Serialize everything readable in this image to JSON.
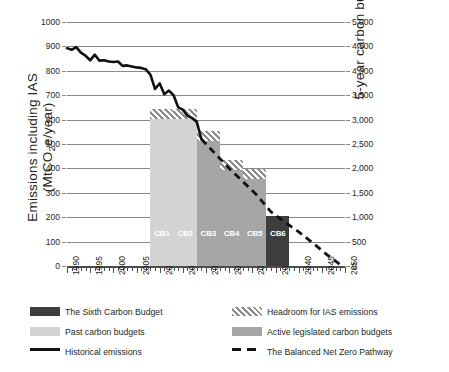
{
  "chart_data": {
    "type": "bar",
    "title": "",
    "ylabel_left_line1": "Emissions including IAS",
    "ylabel_left_line2": "(MtCO2e/year)",
    "ylabel_right": "5-year carbon budget (MtCO2e)",
    "xlabel": "",
    "xlim": [
      1990,
      2050
    ],
    "ylim_left": [
      0,
      1000
    ],
    "ylim_right": [
      0,
      5000
    ],
    "grid": true,
    "legend_position": "below",
    "y_ticks_left": [
      "0",
      "100",
      "200",
      "300",
      "400",
      "500",
      "600",
      "700",
      "800",
      "900",
      "1000"
    ],
    "y_ticks_right": [
      "0",
      "500",
      "1,000",
      "1,500",
      "2,000",
      "2,500",
      "3,000",
      "3,500",
      "4,000",
      "4,500",
      "5,000"
    ],
    "x_ticks": [
      "1990",
      "1995",
      "2000",
      "2005",
      "2010",
      "2015",
      "2020",
      "2025",
      "2030",
      "2035",
      "2040",
      "2045",
      "2050"
    ],
    "categories": [
      "CB1",
      "CB2",
      "CB3",
      "CB4",
      "CB5",
      "CB6"
    ],
    "bars": [
      {
        "label": "CB1",
        "period": "2008-2012",
        "x_start": 2008,
        "x_end": 2013,
        "budget_annual": 602,
        "budget_5yr": 3010,
        "headroom_top": 642,
        "headroom_5yr": 3210,
        "series": "Past carbon budgets",
        "color": "#d3d3d3"
      },
      {
        "label": "CB2",
        "period": "2013-2017",
        "x_start": 2013,
        "x_end": 2018,
        "budget_annual": 602,
        "budget_5yr": 3010,
        "headroom_top": 642,
        "headroom_5yr": 3210,
        "series": "Past carbon budgets",
        "color": "#d3d3d3"
      },
      {
        "label": "CB3",
        "period": "2018-2022",
        "x_start": 2018,
        "x_end": 2023,
        "budget_annual": 513,
        "budget_5yr": 2565,
        "headroom_top": 553,
        "headroom_5yr": 2765,
        "series": "Active legislated carbon budgets",
        "color": "#a6a6a6"
      },
      {
        "label": "CB4",
        "period": "2023-2027",
        "x_start": 2023,
        "x_end": 2028,
        "budget_annual": 393,
        "budget_5yr": 1965,
        "headroom_top": 433,
        "headroom_5yr": 2165,
        "series": "Active legislated carbon budgets",
        "color": "#a6a6a6"
      },
      {
        "label": "CB5",
        "period": "2028-2032",
        "x_start": 2028,
        "x_end": 2033,
        "budget_annual": 356,
        "budget_5yr": 1780,
        "headroom_top": 396,
        "headroom_5yr": 1980,
        "series": "Active legislated carbon budgets",
        "color": "#a6a6a6"
      },
      {
        "label": "CB6",
        "period": "2033-2037",
        "x_start": 2033,
        "x_end": 2038,
        "budget_annual": 203,
        "budget_5yr": 1015,
        "headroom_top": 203,
        "headroom_5yr": 1015,
        "series": "The Sixth Carbon Budget",
        "color": "#3d3d3d"
      }
    ],
    "series": [
      {
        "name": "Historical emissions",
        "type": "line",
        "style": "solid",
        "color": "#111111",
        "x": [
          1990,
          1991,
          1992,
          1993,
          1994,
          1995,
          1996,
          1997,
          1998,
          1999,
          2000,
          2001,
          2002,
          2003,
          2004,
          2005,
          2006,
          2007,
          2008,
          2009,
          2010,
          2011,
          2012,
          2013,
          2014,
          2015,
          2016,
          2017,
          2018,
          2019
        ],
        "values": [
          893,
          886,
          897,
          874,
          862,
          843,
          866,
          842,
          843,
          838,
          836,
          838,
          820,
          822,
          818,
          814,
          812,
          806,
          784,
          726,
          748,
          704,
          719,
          700,
          650,
          641,
          615,
          606,
          592,
          520
        ]
      },
      {
        "name": "The Balanced Net Zero Pathway",
        "type": "line",
        "style": "dashed",
        "color": "#111111",
        "x": [
          2019,
          2022,
          2025,
          2028,
          2031,
          2034,
          2037,
          2040,
          2043,
          2046,
          2049
        ],
        "values": [
          520,
          460,
          400,
          345,
          290,
          222,
          180,
          140,
          95,
          48,
          5
        ]
      }
    ]
  },
  "legend": {
    "items": [
      {
        "label": "The Sixth Carbon Budget",
        "swatch": "solid",
        "color": "#3d3d3d",
        "column": "left"
      },
      {
        "label": "Past carbon budgets",
        "swatch": "solid",
        "color": "#d3d3d3",
        "column": "left"
      },
      {
        "label": "Historical emissions",
        "swatch": "line-solid",
        "color": "#111111",
        "column": "left"
      },
      {
        "label": "Headroom for IAS emissions",
        "swatch": "hatch",
        "color": "#8c8c8c",
        "column": "right"
      },
      {
        "label": "Active legislated carbon budgets",
        "swatch": "solid",
        "color": "#a6a6a6",
        "column": "right"
      },
      {
        "label": "The Balanced Net Zero Pathway",
        "swatch": "line-dashed",
        "color": "#111111",
        "column": "right"
      }
    ]
  },
  "colors": {
    "grid": "#8a8a8a",
    "text": "#231f20",
    "past_budget": "#d3d3d3",
    "active_budget": "#a6a6a6",
    "sixth_budget": "#3d3d3d",
    "line": "#111111"
  }
}
